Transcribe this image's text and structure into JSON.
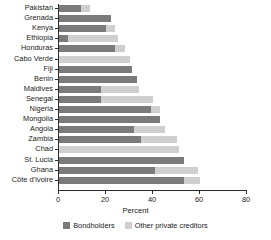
{
  "chart_data": {
    "type": "bar",
    "orientation": "horizontal",
    "stacked": true,
    "title": "",
    "xlabel": "Percent",
    "ylabel": "",
    "xlim": [
      0,
      80
    ],
    "xticks": [
      0,
      20,
      40,
      60,
      80
    ],
    "grid": false,
    "legend_position": "bottom",
    "categories": [
      "Pakistan",
      "Grenada",
      "Kenya",
      "Ethiopia",
      "Honduras",
      "Cabo Verde",
      "Fiji",
      "Benin",
      "Maldives",
      "Senegal",
      "Nigeria",
      "Mongolia",
      "Angola",
      "Zambia",
      "Chad",
      "St. Lucia",
      "Ghana",
      "Côte d'Ivoire"
    ],
    "series": [
      {
        "name": "Bondholders",
        "color": "#7b7b7b",
        "values": [
          9.5,
          22,
          20,
          4,
          24,
          0,
          31,
          33,
          18,
          18,
          39,
          43,
          32,
          35,
          0,
          53,
          41,
          53
        ]
      },
      {
        "name": "Other private creditors",
        "color": "#cfcfcf",
        "values": [
          3.5,
          0,
          4,
          21,
          4,
          30,
          0,
          0,
          16,
          22,
          4,
          0,
          13,
          15,
          51,
          0,
          18,
          7
        ]
      }
    ],
    "totals": [
      13,
      22,
      24,
      25,
      28,
      30,
      31,
      33,
      34,
      40,
      43,
      43,
      45,
      50,
      51,
      53,
      59,
      60
    ]
  },
  "legend": {
    "items": [
      {
        "label": "Bondholders",
        "color": "#7b7b7b"
      },
      {
        "label": "Other private creditors",
        "color": "#cfcfcf"
      }
    ]
  }
}
